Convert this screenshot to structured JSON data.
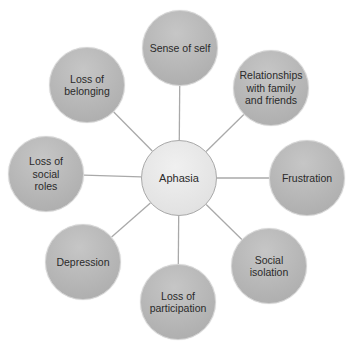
{
  "diagram": {
    "type": "hub-and-spoke",
    "center": {
      "label": "Aphasia",
      "x": 179,
      "y": 178
    },
    "nodes": [
      {
        "id": "sense-of-self",
        "label": "Sense of self",
        "x": 180,
        "y": 48
      },
      {
        "id": "relationships",
        "label": "Relationships\nwith family\nand friends",
        "x": 271,
        "y": 88
      },
      {
        "id": "frustration",
        "label": "Frustration",
        "x": 307,
        "y": 178
      },
      {
        "id": "social-isolation",
        "label": "Social\nisolation",
        "x": 269,
        "y": 266
      },
      {
        "id": "loss-of-participation",
        "label": "Loss of\nparticipation",
        "x": 178,
        "y": 302
      },
      {
        "id": "depression",
        "label": "Depression",
        "x": 83,
        "y": 262
      },
      {
        "id": "loss-of-social-roles",
        "label": "Loss of social\nroles",
        "x": 46,
        "y": 174
      },
      {
        "id": "loss-of-belonging",
        "label": "Loss of\nbelonging",
        "x": 87,
        "y": 85
      }
    ],
    "colors": {
      "outer_fill": "#b6b6b6",
      "center_fill": "#e6e6e6",
      "center_border": "#a8a8a8",
      "connector": "#a9a9a9",
      "text": "#2a2a2a"
    }
  }
}
